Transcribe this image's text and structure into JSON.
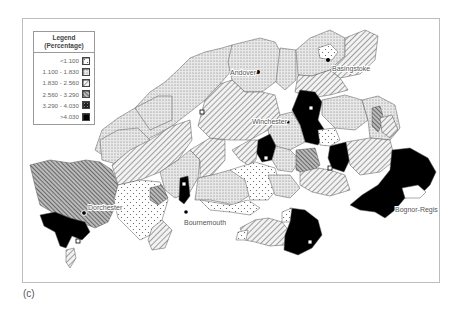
{
  "figure": {
    "caption": "(c)"
  },
  "legend": {
    "title_line1": "Legend",
    "title_line2": "(Percentage)",
    "classes": [
      {
        "label": "<1.100",
        "pattern": "sparse-dots",
        "color": "#ffffff"
      },
      {
        "label": "1.100 - 1.830",
        "pattern": "dense-dots",
        "color": "#dcdcdc"
      },
      {
        "label": "1.830 - 2.560",
        "pattern": "light-diagonal-hatch",
        "color": "#bdbdbd"
      },
      {
        "label": "2.560 - 3.290",
        "pattern": "dark-diagonal-hatch",
        "color": "#888888"
      },
      {
        "label": "3.290 - 4.030",
        "pattern": "dark-crosshatch",
        "color": "#333333"
      },
      {
        "label": ">4.030",
        "pattern": "solid-black",
        "color": "#000000"
      }
    ]
  },
  "cities": [
    {
      "name": "Andover",
      "marker": "filled-dot"
    },
    {
      "name": "Basingstoke",
      "marker": "filled-dot"
    },
    {
      "name": "Winchester",
      "marker": "filled-dot"
    },
    {
      "name": "Dorchester",
      "marker": "filled-dot"
    },
    {
      "name": "Bournemouth",
      "marker": "filled-dot"
    },
    {
      "name": "Bognor-Regis",
      "marker": "filled-dot"
    }
  ],
  "map": {
    "region": "Southern England (Dorset, Hampshire, Isle of Wight, West Sussex)",
    "colors": {
      "border": "#555555",
      "frame": "#bdbdbd",
      "label_text": "#555555"
    }
  }
}
